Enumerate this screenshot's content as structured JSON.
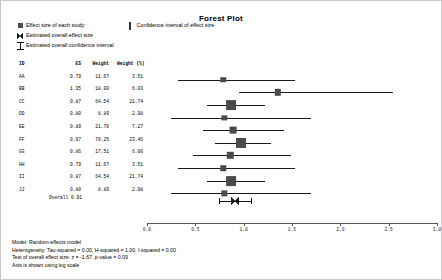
{
  "chart_data": {
    "type": "forest",
    "title": "Forest Plot",
    "xlabel": "",
    "ylabel": "",
    "xlim": [
      0.0,
      3.0
    ],
    "xticks": [
      "0.0",
      "0.5",
      "1.0",
      "1.5",
      "2.0",
      "2.5",
      "3.0"
    ],
    "grid": false,
    "log_scale": true,
    "columns": [
      "ID",
      "ES",
      "Weight",
      "Weight (%)"
    ],
    "studies": [
      {
        "id": "AA",
        "es": "0.79",
        "weight": "11.67",
        "weight_pct": "3.51",
        "ci_low": 0.32,
        "ci_high": 1.53
      },
      {
        "id": "BB",
        "es": "1.35",
        "weight": "18.00",
        "weight_pct": "6.03",
        "ci_low": 0.95,
        "ci_high": 2.55
      },
      {
        "id": "CC",
        "es": "0.87",
        "weight": "64.54",
        "weight_pct": "21.74",
        "ci_low": 0.62,
        "ci_high": 1.22
      },
      {
        "id": "DD",
        "es": "0.80",
        "weight": "8.89",
        "weight_pct": "2.98",
        "ci_low": 0.25,
        "ci_high": 1.7
      },
      {
        "id": "EE",
        "es": "0.89",
        "weight": "21.70",
        "weight_pct": "7.27",
        "ci_low": 0.58,
        "ci_high": 1.42
      },
      {
        "id": "FF",
        "es": "0.97",
        "weight": "70.25",
        "weight_pct": "23.46",
        "ci_low": 0.7,
        "ci_high": 1.28
      },
      {
        "id": "GG",
        "es": "0.86",
        "weight": "17.51",
        "weight_pct": "6.00",
        "ci_low": 0.48,
        "ci_high": 1.49
      },
      {
        "id": "HH",
        "es": "0.79",
        "weight": "11.67",
        "weight_pct": "3.51",
        "ci_low": 0.32,
        "ci_high": 1.53
      },
      {
        "id": "II",
        "es": "0.87",
        "weight": "64.54",
        "weight_pct": "21.74",
        "ci_low": 0.62,
        "ci_high": 1.22
      },
      {
        "id": "JJ",
        "es": "0.80",
        "weight": "8.89",
        "weight_pct": "2.98",
        "ci_low": 0.25,
        "ci_high": 1.7
      }
    ],
    "overall": {
      "label": "Overall",
      "es": "0.91",
      "ci_low": 0.8,
      "ci_high": 1.02
    }
  },
  "legend": {
    "items": [
      {
        "key": "square-marker",
        "label": "Effect size of each study"
      },
      {
        "key": "diamond-marker",
        "label": "Estimated overall effect size"
      },
      {
        "key": "ibar-marker",
        "label": "Estimated overall confidence interval"
      }
    ],
    "ci_item": {
      "key": "vline-marker",
      "label": "Confidence interval of effect size"
    }
  },
  "footer": {
    "lines": [
      "Model: Random-effects model",
      "Heterogeneity: Tau-squared = 0.00, H-squared = 1.00, I-squared = 0.00",
      "Test of overall effect size: z = -1.67, p-value = 0.09",
      "Axis is shown using log scale"
    ]
  }
}
